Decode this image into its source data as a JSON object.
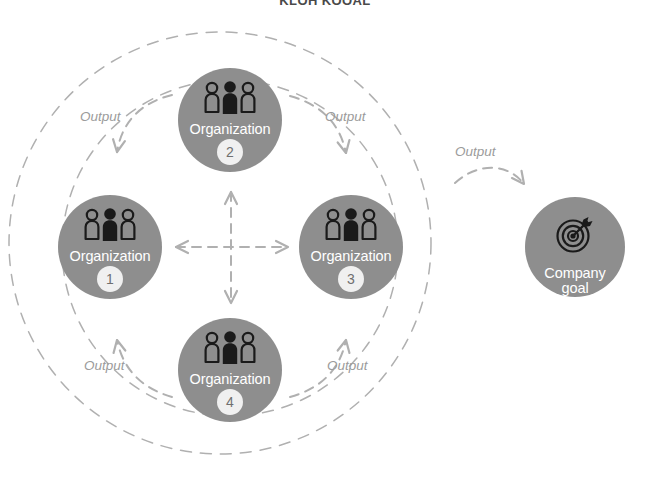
{
  "title": "KLOH KOOAL",
  "colors": {
    "node_fill": "#8e8e8e",
    "node_label": "#ffffff",
    "badge_fill": "#f0f0f0",
    "badge_text": "#6f6f6f",
    "dashed_stroke": "#b0b0b0",
    "output_text": "#9b9b9b",
    "background": "#ffffff",
    "icon_dark": "#1a1a1a"
  },
  "nodes": {
    "org1": {
      "label": "Organization",
      "badge": "1",
      "icon": "people-group-icon"
    },
    "org2": {
      "label": "Organization",
      "badge": "2",
      "icon": "people-group-icon"
    },
    "org3": {
      "label": "Organization",
      "badge": "3",
      "icon": "people-group-icon"
    },
    "org4": {
      "label": "Organization",
      "badge": "4",
      "icon": "people-group-icon"
    },
    "goal": {
      "label_line1": "Company",
      "label_line2": "goal",
      "icon": "target-dartboard-icon"
    }
  },
  "edges": {
    "output_top_left": "Output",
    "output_top_right": "Output",
    "output_bottom_left": "Output",
    "output_bottom_right": "Output",
    "output_to_goal": "Output"
  }
}
